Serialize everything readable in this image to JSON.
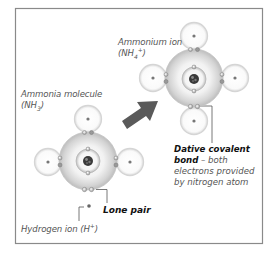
{
  "labels": {
    "ammonium_title": "Ammonium ion",
    "ammonium_formula_pre": "(NH",
    "ammonium_formula_sub": "4",
    "ammonium_formula_sup": "+",
    "ammonium_formula_post": ")",
    "ammonia_title": "Ammonia molecule",
    "ammonia_formula_pre": "(NH",
    "ammonia_formula_sub": "3",
    "ammonia_formula_post": ")",
    "lone_pair": "Lone pair",
    "hydrogen_ion_pre": "Hydrogen ion (H",
    "hydrogen_ion_sup": "+",
    "hydrogen_ion_post": ")",
    "dative_bold_1": "Dative covalent",
    "dative_bold_2": "bond",
    "dative_rest_1": " – both",
    "dative_rest_2": "electrons provided",
    "dative_rest_3": "by nitrogen atom"
  },
  "colors": {
    "frame": "#8a8a8a",
    "arrow": "#5a5a5a",
    "leader": "#555555",
    "shell": "#d9d9d9",
    "nucleus": "#333333"
  },
  "molecules": [
    {
      "name": "ammonia",
      "center": [
        88,
        161
      ],
      "hydrogens": [
        [
          88,
          119
        ],
        [
          48,
          162
        ],
        [
          130,
          162
        ]
      ]
    },
    {
      "name": "ammonium",
      "center": [
        194,
        78
      ],
      "hydrogens": [
        [
          194,
          36
        ],
        [
          153,
          78
        ],
        [
          235,
          78
        ],
        [
          194,
          121
        ]
      ]
    }
  ],
  "hydrogen_ion": [
    89,
    206
  ]
}
